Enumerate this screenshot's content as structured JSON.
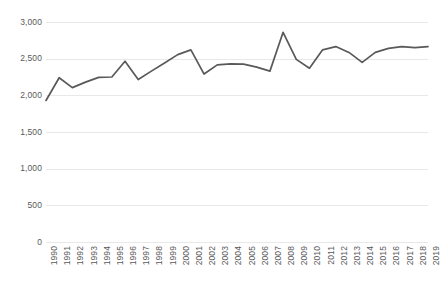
{
  "chart_data": {
    "type": "line",
    "title": "",
    "subtitle": "",
    "xlabel": "",
    "ylabel": "",
    "grid": true,
    "legend": false,
    "legend_position": "none",
    "line_color": "#595959",
    "gridline_color": "#E8E8E8",
    "background_color": "#FFFFFF",
    "ylim": [
      0,
      3000
    ],
    "ytick_labels": [
      "3,000",
      "2,500",
      "2,000",
      "1,500",
      "1,000",
      "500",
      "0"
    ],
    "ytick_values": [
      3000,
      2500,
      2000,
      1500,
      1000,
      500,
      0
    ],
    "categories": [
      "1990",
      "1991",
      "1992",
      "1993",
      "1994",
      "1995",
      "1996",
      "1997",
      "1998",
      "1999",
      "2000",
      "2001",
      "2002",
      "2003",
      "2004",
      "2005",
      "2006",
      "2007",
      "2008",
      "2009",
      "2010",
      "2011",
      "2012",
      "2013",
      "2014",
      "2015",
      "2016",
      "2017",
      "2018",
      "2019"
    ],
    "values": [
      1930,
      2240,
      2105,
      2180,
      2245,
      2250,
      2465,
      2215,
      2330,
      2440,
      2555,
      2620,
      2290,
      2415,
      2430,
      2425,
      2385,
      2330,
      2860,
      2490,
      2370,
      2620,
      2665,
      2585,
      2450,
      2585,
      2640,
      2665,
      2650,
      2665
    ]
  }
}
